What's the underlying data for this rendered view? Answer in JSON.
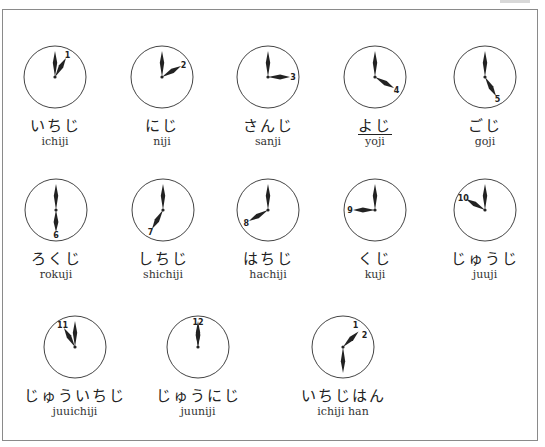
{
  "colors": {
    "ink": "#222222",
    "frame": "#8a8a8a",
    "background": "#ffffff"
  },
  "clocks": [
    {
      "id": "1",
      "hour": 1,
      "minute": 0,
      "numeral": "1",
      "kana": "いちじ",
      "romaji": "ichiji",
      "cx": 55,
      "cy": 77,
      "underline": false
    },
    {
      "id": "2",
      "hour": 2,
      "minute": 0,
      "numeral": "2",
      "kana": "にじ",
      "romaji": "niji",
      "cx": 162,
      "cy": 77,
      "underline": false
    },
    {
      "id": "3",
      "hour": 3,
      "minute": 0,
      "numeral": "3",
      "kana": "さんじ",
      "romaji": "sanji",
      "cx": 268,
      "cy": 77,
      "underline": false
    },
    {
      "id": "4",
      "hour": 4,
      "minute": 0,
      "numeral": "4",
      "kana": "よじ",
      "romaji": "yoji",
      "cx": 375,
      "cy": 77,
      "underline": true
    },
    {
      "id": "5",
      "hour": 5,
      "minute": 0,
      "numeral": "5",
      "kana": "ごじ",
      "romaji": "goji",
      "cx": 485,
      "cy": 77,
      "underline": false
    },
    {
      "id": "6",
      "hour": 6,
      "minute": 0,
      "numeral": "6",
      "kana": "ろくじ",
      "romaji": "rokuji",
      "cx": 56,
      "cy": 210,
      "underline": false
    },
    {
      "id": "7",
      "hour": 7,
      "minute": 0,
      "numeral": "7",
      "kana": "しちじ",
      "romaji": "shichiji",
      "cx": 163,
      "cy": 210,
      "underline": false
    },
    {
      "id": "8",
      "hour": 8,
      "minute": 0,
      "numeral": "8",
      "kana": "はちじ",
      "romaji": "hachiji",
      "cx": 268,
      "cy": 210,
      "underline": false
    },
    {
      "id": "9",
      "hour": 9,
      "minute": 0,
      "numeral": "9",
      "kana": "くじ",
      "romaji": "kuji",
      "cx": 375,
      "cy": 210,
      "underline": false
    },
    {
      "id": "10",
      "hour": 10,
      "minute": 0,
      "numeral": "10",
      "kana": "じゅうじ",
      "romaji": "juuji",
      "cx": 485,
      "cy": 210,
      "underline": false
    },
    {
      "id": "11",
      "hour": 11,
      "minute": 0,
      "numeral": "11",
      "kana": "じゅういちじ",
      "romaji": "juuichiji",
      "cx": 75,
      "cy": 347,
      "underline": false
    },
    {
      "id": "12",
      "hour": 12,
      "minute": 0,
      "numeral": "12",
      "kana": "じゅうにじ",
      "romaji": "juuniji",
      "cx": 198,
      "cy": 347,
      "underline": false
    },
    {
      "id": "13",
      "hour": 1,
      "minute": 30,
      "numeral": "1",
      "numeral2": "2",
      "kana": "いちじはん",
      "romaji": "ichiji han",
      "cx": 343,
      "cy": 347,
      "underline": false
    }
  ]
}
